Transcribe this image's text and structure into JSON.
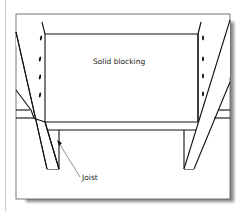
{
  "figure": {
    "labels": {
      "blocking": "Solid blocking",
      "joist": "Joist"
    },
    "colors": {
      "stroke": "#111111",
      "frame": "#555555",
      "shadow": "#7a7a7a",
      "page_rule": "#c8c8c8",
      "leader": "#444444"
    }
  }
}
